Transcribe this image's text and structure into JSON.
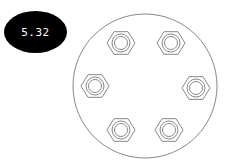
{
  "badge": {
    "value": "5.32",
    "background": "#000000",
    "text_color": "#ffffff"
  },
  "diagram": {
    "outline_color": "#888888",
    "plate": {
      "cx": 145,
      "cy": 86,
      "r": 72
    },
    "nuts": [
      {
        "id": "nut-top-left",
        "cx": 121,
        "cy": 43
      },
      {
        "id": "nut-top-right",
        "cx": 171,
        "cy": 43
      },
      {
        "id": "nut-middle-left",
        "cx": 95,
        "cy": 86
      },
      {
        "id": "nut-middle-right",
        "cx": 196,
        "cy": 88
      },
      {
        "id": "nut-bottom-left",
        "cx": 121,
        "cy": 130
      },
      {
        "id": "nut-bottom-right",
        "cx": 169,
        "cy": 130
      }
    ]
  }
}
